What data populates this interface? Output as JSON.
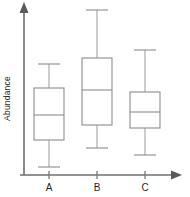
{
  "chart_data": {
    "type": "box",
    "title": "",
    "xlabel": "",
    "ylabel": "Abundance",
    "categories": [
      "A",
      "B",
      "C"
    ],
    "grid": false,
    "legend": null,
    "y_axis": {
      "ticks_shown": false,
      "scale": "arbitrary units",
      "arrow_head": true,
      "axis_pixel_x": 24,
      "axis_pixel_top": 6,
      "axis_pixel_bottom": 175
    },
    "x_axis": {
      "ticks_shown": true,
      "arrow_head": true,
      "axis_pixel_y": 175,
      "axis_pixel_left": 20,
      "axis_pixel_right": 180
    },
    "note": "Values are read in pixel space from the screenshot; larger y-pixel = lower abundance.",
    "boxes": [
      {
        "category": "A",
        "center_px": 49,
        "half_width_px": 15,
        "upper_whisker_px": 64,
        "q3_px": 88,
        "median_px": 115,
        "q1_px": 140,
        "lower_whisker_px": 167,
        "relative_values": {
          "lower_whisker": 0.05,
          "q1": 0.21,
          "median": 0.35,
          "q3": 0.51,
          "upper_whisker": 0.66
        }
      },
      {
        "category": "B",
        "center_px": 97,
        "half_width_px": 15,
        "upper_whisker_px": 10,
        "q3_px": 58,
        "median_px": 90,
        "q1_px": 125,
        "lower_whisker_px": 148,
        "relative_values": {
          "lower_whisker": 0.16,
          "q1": 0.3,
          "median": 0.5,
          "q3": 0.69,
          "upper_whisker": 0.98
        }
      },
      {
        "category": "C",
        "center_px": 145,
        "half_width_px": 15,
        "upper_whisker_px": 50,
        "q3_px": 92,
        "median_px": 112,
        "q1_px": 128,
        "lower_whisker_px": 155,
        "relative_values": {
          "lower_whisker": 0.12,
          "q1": 0.28,
          "median": 0.37,
          "q3": 0.49,
          "upper_whisker": 0.74
        }
      }
    ]
  },
  "axis": {
    "y_title": "Abundance"
  },
  "ticks": {
    "a_label": "A",
    "b_label": "B",
    "c_label": "C"
  }
}
